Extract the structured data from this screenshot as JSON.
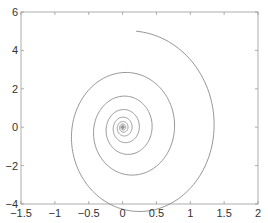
{
  "chart_data": {
    "type": "line",
    "title": "",
    "xlabel": "",
    "ylabel": "",
    "xlim": [
      -1.5,
      2
    ],
    "ylim": [
      -4,
      6
    ],
    "grid": false,
    "legend": null,
    "x_ticks": [
      -1.5,
      -1,
      -0.5,
      0,
      0.5,
      1,
      1.5,
      2
    ],
    "x_tick_labels": [
      "−1.5",
      "−1",
      "−0.5",
      "0",
      "0.5",
      "1",
      "1.5",
      "2"
    ],
    "y_ticks": [
      -4,
      -2,
      0,
      2,
      4,
      6
    ],
    "y_tick_labels": [
      "−4",
      "−2",
      "0",
      "2",
      "4",
      "6"
    ],
    "line_color": "#8a8a8a",
    "axis_color": "#999999",
    "series": [
      {
        "name": "spiral trajectory",
        "description": "Clockwise decaying spiral starting at (0, 5) and converging to (0, 0)",
        "start": [
          0,
          5
        ],
        "end": [
          0,
          0
        ],
        "key_points": [
          {
            "x": 0,
            "y": 5
          },
          {
            "x": 1.55,
            "y": -0.2
          },
          {
            "x": 0.2,
            "y": -3.9
          },
          {
            "x": -1.15,
            "y": -0.1
          },
          {
            "x": 0,
            "y": 3.0
          },
          {
            "x": 0.95,
            "y": 0
          },
          {
            "x": 0.1,
            "y": -2.3
          },
          {
            "x": -0.7,
            "y": 0
          },
          {
            "x": 0,
            "y": 1.8
          },
          {
            "x": 0.55,
            "y": 0
          },
          {
            "x": 0,
            "y": 0
          }
        ],
        "model": {
          "decay": 0.09,
          "x_amp": 1.35,
          "y_amp": 4.45,
          "x_center": 0.2,
          "y_center": -0.4,
          "turns": 9.5
        }
      }
    ]
  }
}
